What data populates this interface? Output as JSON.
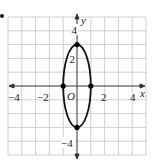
{
  "figure": {
    "type": "coordinate-graph",
    "curve": "ellipse",
    "axes": {
      "x_label": "x",
      "y_label": "y",
      "origin_label": "O",
      "x_ticks": [
        {
          "value": -4,
          "label": "−4"
        },
        {
          "value": -2,
          "label": "−2"
        },
        {
          "value": 2,
          "label": "2"
        },
        {
          "value": 4,
          "label": "4"
        }
      ],
      "y_ticks": [
        {
          "value": 4,
          "label": "4"
        },
        {
          "value": 2,
          "label": "2"
        },
        {
          "value": -4,
          "label": "−4"
        }
      ],
      "range": {
        "x": [
          -5,
          5
        ],
        "y": [
          -5,
          5
        ]
      }
    },
    "ellipse": {
      "center": [
        0,
        0
      ],
      "semi_axis_x": 1,
      "semi_axis_y": 3
    },
    "points": [
      {
        "x": 0,
        "y": 3
      },
      {
        "x": 0,
        "y": -3
      },
      {
        "x": -1,
        "y": 0
      },
      {
        "x": 1,
        "y": 0
      }
    ],
    "colors": {
      "grid": "#bdbdbd",
      "axis": "#333333",
      "curve": "#111111",
      "point": "#000000"
    }
  }
}
